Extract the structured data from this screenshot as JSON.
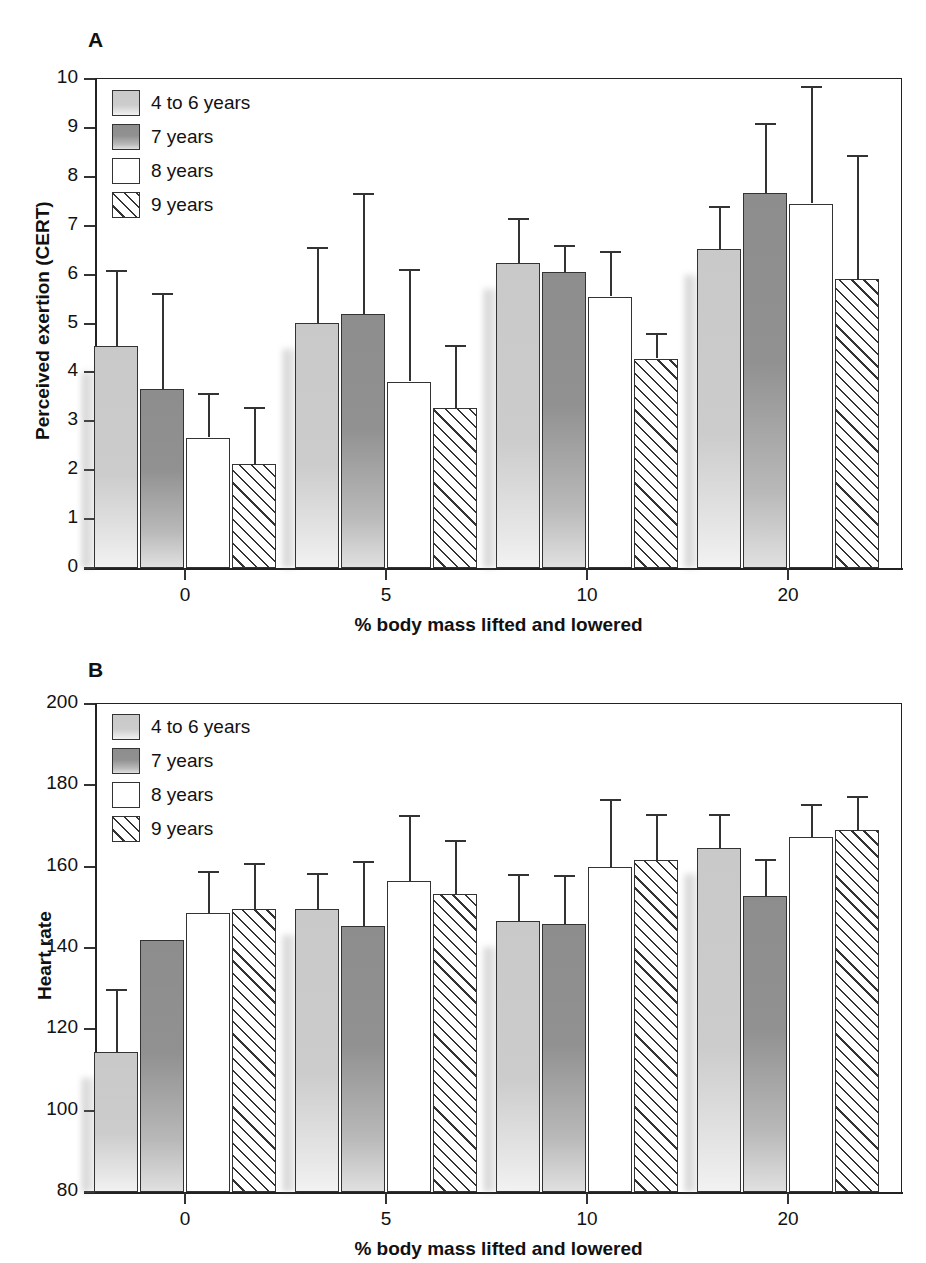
{
  "figure": {
    "panels": [
      {
        "letter": "A"
      },
      {
        "letter": "B"
      }
    ]
  },
  "legend": {
    "entries": [
      {
        "label": "4 to 6 years",
        "swatch": "light-gray-gradient",
        "color": "#cccccc"
      },
      {
        "label": "7 years",
        "swatch": "dark-gray-gradient",
        "color": "#8d8d8d"
      },
      {
        "label": "8 years",
        "swatch": "white",
        "color": "#ffffff"
      },
      {
        "label": "9 years",
        "swatch": "diagonal-hatch",
        "color": "#ffffff"
      }
    ]
  },
  "chart_data": [
    {
      "type": "bar",
      "panel": "A",
      "title": "",
      "xlabel": "% body mass lifted and lowered",
      "ylabel": "Perceived exertion (CERT)",
      "categories": [
        "0",
        "5",
        "10",
        "20"
      ],
      "ylim": [
        0,
        10
      ],
      "yticks": [
        0,
        1,
        2,
        3,
        4,
        5,
        6,
        7,
        8,
        9,
        10
      ],
      "grid": false,
      "legend_position": "top-left-inside",
      "error_bars": "upper-only",
      "series": [
        {
          "name": "4 to 6 years",
          "values": [
            4.53,
            5.02,
            6.24,
            6.52
          ],
          "errors": [
            1.57,
            1.55,
            0.92,
            0.88
          ]
        },
        {
          "name": "7 years",
          "values": [
            3.66,
            5.19,
            6.06,
            7.66
          ],
          "errors": [
            1.97,
            2.48,
            0.55,
            1.44
          ]
        },
        {
          "name": "8 years",
          "values": [
            2.66,
            3.81,
            5.55,
            7.45
          ],
          "errors": [
            0.91,
            2.3,
            0.93,
            2.4
          ]
        },
        {
          "name": "9 years",
          "values": [
            2.13,
            3.28,
            4.28,
            5.92
          ],
          "errors": [
            1.17,
            1.28,
            0.52,
            2.53
          ]
        }
      ]
    },
    {
      "type": "bar",
      "panel": "B",
      "title": "",
      "xlabel": "% body mass lifted and lowered",
      "ylabel": "Heart rate",
      "categories": [
        "0",
        "5",
        "10",
        "20"
      ],
      "ylim": [
        80,
        200
      ],
      "yticks": [
        80,
        100,
        120,
        140,
        160,
        180,
        200
      ],
      "grid": false,
      "legend_position": "top-left-inside",
      "error_bars": "upper-only",
      "series": [
        {
          "name": "4 to 6 years",
          "values": [
            114.5,
            149.5,
            146.6,
            164.5
          ],
          "errors": [
            15.5,
            9.0,
            11.6,
            8.5
          ]
        },
        {
          "name": "7 years",
          "values": [
            142.0,
            145.3,
            145.9,
            152.8
          ],
          "errors": [
            0.0,
            16.2,
            12.0,
            9.0
          ]
        },
        {
          "name": "8 years",
          "values": [
            148.5,
            156.5,
            160.0,
            167.3
          ],
          "errors": [
            10.5,
            16.3,
            16.6,
            8.0
          ]
        },
        {
          "name": "9 years",
          "values": [
            149.5,
            153.3,
            161.6,
            169.0
          ],
          "errors": [
            11.5,
            13.3,
            11.4,
            8.5
          ]
        }
      ]
    }
  ]
}
